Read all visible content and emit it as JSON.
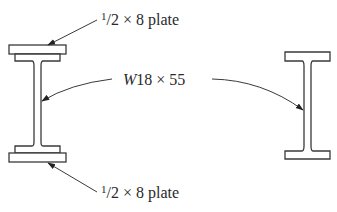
{
  "diagram": {
    "type": "steel cross-sections",
    "labels": {
      "top_plate": {
        "frac": "1/2",
        "fraction_numerator": "1",
        "fraction_slash": "/",
        "fraction_denominator": "2",
        "rest": " × 8 plate"
      },
      "bottom_plate": {
        "frac": "1/2",
        "fraction_numerator": "1",
        "fraction_slash": "/",
        "fraction_denominator": "2",
        "rest": " × 8 plate"
      },
      "wide_flange": {
        "italic_prefix": "W",
        "rest": "18 × 55"
      }
    },
    "shapes": [
      {
        "name": "built-up-section",
        "description": "W18×55 with 1/2×8 cover plates top and bottom"
      },
      {
        "name": "plain-w-section",
        "description": "W18×55 alone"
      }
    ],
    "colors": {
      "line": "#3a3a3a",
      "text": "#2a2a2a",
      "background": "#ffffff"
    }
  }
}
